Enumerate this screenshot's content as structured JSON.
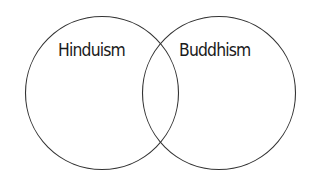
{
  "diagram": {
    "type": "venn",
    "sets": [
      {
        "label": "Hinduism"
      },
      {
        "label": "Buddhism"
      }
    ],
    "colors": {
      "stroke": "#333333",
      "background": "#ffffff",
      "text": "#1a1a1a"
    }
  }
}
